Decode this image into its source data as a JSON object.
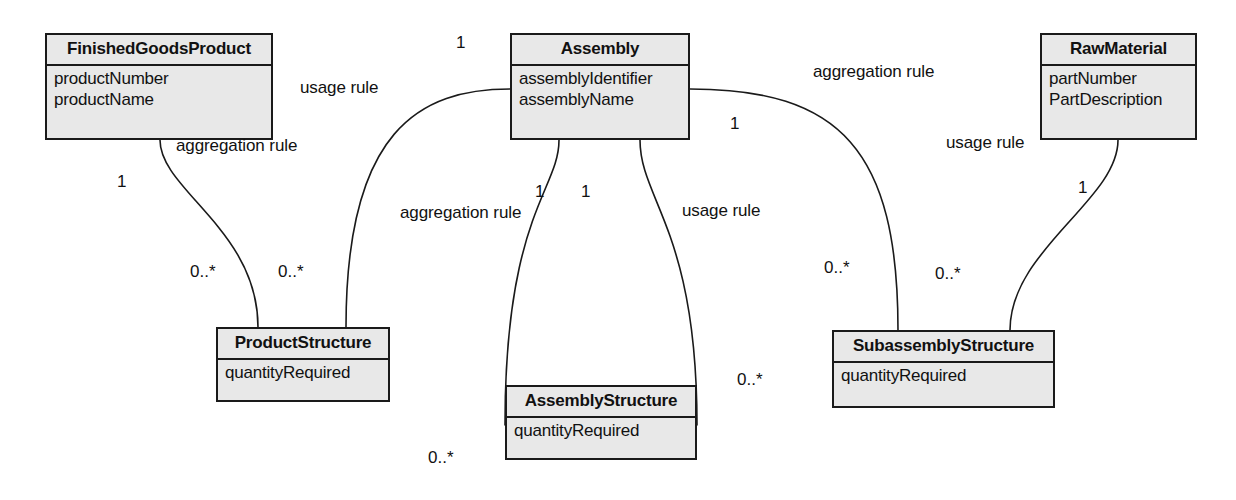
{
  "diagram": {
    "type": "uml-class-diagram",
    "style": {
      "box_fill": "#e8e8e8",
      "box_border": "#1a1a1a",
      "line_color": "#1a1a1a",
      "background": "#ffffff",
      "text_color": "#111111"
    },
    "classes": [
      {
        "id": "finished_goods_product",
        "name": "FinishedGoodsProduct",
        "attributes": [
          "productNumber",
          "productName"
        ],
        "x": 45,
        "y": 33,
        "w": 228,
        "h": 107
      },
      {
        "id": "assembly",
        "name": "Assembly",
        "attributes": [
          "assemblyIdentifier",
          "assemblyName"
        ],
        "x": 510,
        "y": 33,
        "w": 180,
        "h": 107
      },
      {
        "id": "raw_material",
        "name": "RawMaterial",
        "attributes": [
          "partNumber",
          "PartDescription"
        ],
        "x": 1040,
        "y": 33,
        "w": 157,
        "h": 107
      },
      {
        "id": "product_structure",
        "name": "ProductStructure",
        "attributes": [
          "quantityRequired"
        ],
        "x": 216,
        "y": 327,
        "w": 174,
        "h": 75
      },
      {
        "id": "assembly_structure",
        "name": "AssemblyStructure",
        "attributes": [
          "quantityRequired"
        ],
        "x": 505,
        "y": 385,
        "w": 192,
        "h": 75
      },
      {
        "id": "subassembly_structure",
        "name": "SubassemblyStructure",
        "attributes": [
          "quantityRequired"
        ],
        "x": 832,
        "y": 330,
        "w": 223,
        "h": 78
      }
    ],
    "relationship_labels": [
      {
        "id": "usage_rule_product",
        "text": "usage rule",
        "x": 300,
        "y": 78
      },
      {
        "id": "aggregation_rule_product",
        "text": "aggregation rule",
        "x": 176,
        "y": 136
      },
      {
        "id": "aggregation_rule_right",
        "text": "aggregation rule",
        "x": 813,
        "y": 62
      },
      {
        "id": "usage_rule_raw",
        "text": "usage rule",
        "x": 946,
        "y": 133
      },
      {
        "id": "aggregation_rule_mid",
        "text": "aggregation rule",
        "x": 400,
        "y": 203
      },
      {
        "id": "usage_rule_mid",
        "text": "usage rule",
        "x": 682,
        "y": 201
      }
    ],
    "multiplicities": [
      {
        "id": "mult_assembly_top_left",
        "text": "1",
        "x": 456,
        "y": 33
      },
      {
        "id": "mult_finished_goods",
        "text": "1",
        "x": 117,
        "y": 172
      },
      {
        "id": "mult_assembly_right",
        "text": "1",
        "x": 730,
        "y": 114
      },
      {
        "id": "mult_raw_material",
        "text": "1",
        "x": 1078,
        "y": 178
      },
      {
        "id": "mult_assembly_mid_left",
        "text": "1",
        "x": 535,
        "y": 182
      },
      {
        "id": "mult_assembly_mid_right",
        "text": "1",
        "x": 581,
        "y": 182
      },
      {
        "id": "mult_product_structure_l",
        "text": "0..*",
        "x": 190,
        "y": 262
      },
      {
        "id": "mult_product_structure_r",
        "text": "0..*",
        "x": 278,
        "y": 262
      },
      {
        "id": "mult_subassembly_left",
        "text": "0..*",
        "x": 824,
        "y": 258
      },
      {
        "id": "mult_subassembly_right",
        "text": "0..*",
        "x": 935,
        "y": 264
      },
      {
        "id": "mult_assembly_struct_right",
        "text": "0..*",
        "x": 737,
        "y": 370
      },
      {
        "id": "mult_assembly_struct_bot",
        "text": "0..*",
        "x": 428,
        "y": 448
      }
    ],
    "connectors": [
      {
        "id": "edge-finishedgoods-productstructure",
        "from": "finished_goods_product",
        "to": "product_structure",
        "rule": "aggregation rule",
        "path": "M 160 140 C 160 190, 258 230, 258 327"
      },
      {
        "id": "edge-assembly-productstructure",
        "from": "assembly",
        "to": "product_structure",
        "rule": "usage rule",
        "path": "M 510 89 C 420 89, 346 130, 346 327"
      },
      {
        "id": "edge-assembly-assemblystructure-agg",
        "from": "assembly",
        "to": "assembly_structure",
        "rule": "aggregation rule",
        "path": "M 559 140 C 559 190, 505 215, 505 425"
      },
      {
        "id": "edge-assembly-assemblystructure-use",
        "from": "assembly",
        "to": "assembly_structure",
        "rule": "usage rule",
        "path": "M 640 140 C 640 200, 697 230, 697 425"
      },
      {
        "id": "edge-assembly-subassembly",
        "from": "assembly",
        "to": "subassembly_structure",
        "rule": "aggregation rule",
        "path": "M 690 89 C 840 89, 898 150, 898 330"
      },
      {
        "id": "edge-rawmaterial-subassembly",
        "from": "raw_material",
        "to": "subassembly_structure",
        "rule": "usage rule",
        "path": "M 1118 140 C 1118 200, 1010 250, 1010 330"
      }
    ]
  }
}
